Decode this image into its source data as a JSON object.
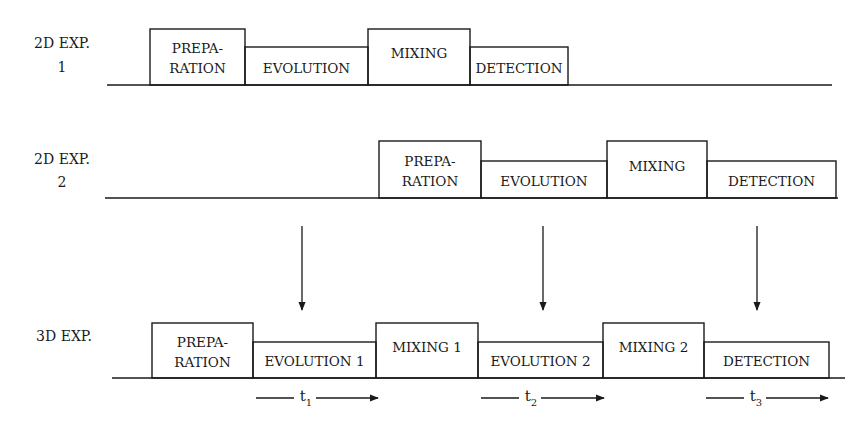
{
  "colors": {
    "line": "#1a1a1a",
    "background": "#ffffff"
  },
  "rows": [
    {
      "id": "2d-exp-1",
      "label_lines": [
        "2D EXP.",
        "1"
      ],
      "blocks": [
        {
          "id": "preparation",
          "lines": [
            "PREPA-",
            "RATION"
          ],
          "level": "tall"
        },
        {
          "id": "evolution",
          "lines": [
            "EVOLUTION"
          ],
          "level": "short"
        },
        {
          "id": "mixing",
          "lines": [
            "MIXING"
          ],
          "level": "tall"
        },
        {
          "id": "detection",
          "lines": [
            "DETECTION"
          ],
          "level": "short"
        }
      ]
    },
    {
      "id": "2d-exp-2",
      "label_lines": [
        "2D EXP.",
        "2"
      ],
      "blocks": [
        {
          "id": "preparation",
          "lines": [
            "PREPA-",
            "RATION"
          ],
          "level": "tall"
        },
        {
          "id": "evolution",
          "lines": [
            "EVOLUTION"
          ],
          "level": "short"
        },
        {
          "id": "mixing",
          "lines": [
            "MIXING"
          ],
          "level": "tall"
        },
        {
          "id": "detection",
          "lines": [
            "DETECTION"
          ],
          "level": "short"
        }
      ]
    },
    {
      "id": "3d-exp",
      "label_lines": [
        "3D EXP."
      ],
      "blocks": [
        {
          "id": "preparation",
          "lines": [
            "PREPA-",
            "RATION"
          ],
          "level": "tall"
        },
        {
          "id": "evolution-1",
          "lines": [
            "EVOLUTION 1"
          ],
          "level": "short"
        },
        {
          "id": "mixing-1",
          "lines": [
            "MIXING 1"
          ],
          "level": "tall"
        },
        {
          "id": "evolution-2",
          "lines": [
            "EVOLUTION 2"
          ],
          "level": "short"
        },
        {
          "id": "mixing-2",
          "lines": [
            "MIXING 2"
          ],
          "level": "tall"
        },
        {
          "id": "detection",
          "lines": [
            "DETECTION"
          ],
          "level": "short"
        }
      ]
    }
  ],
  "time_labels": [
    {
      "id": "t1",
      "base": "t",
      "sub": "1"
    },
    {
      "id": "t2",
      "base": "t",
      "sub": "2"
    },
    {
      "id": "t3",
      "base": "t",
      "sub": "3"
    }
  ],
  "arrows": [
    {
      "id": "arrow-to-evolution-1"
    },
    {
      "id": "arrow-to-evolution-2"
    },
    {
      "id": "arrow-to-detection"
    }
  ]
}
